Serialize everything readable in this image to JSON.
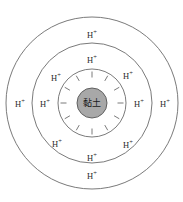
{
  "diagram": {
    "type": "concentric-ion-diagram",
    "title": "",
    "background_color": "#ffffff",
    "center": {
      "x": 92,
      "y": 103
    },
    "core": {
      "label": "黏土",
      "radius": 15,
      "fill_color": "#a8a8a8",
      "stroke_color": "#555555"
    },
    "rings": [
      {
        "name": "inner-ring",
        "radius": 34,
        "stroke_color": "#6b6b6b"
      },
      {
        "name": "middle-ring",
        "radius": 60,
        "stroke_color": "#6b6b6b"
      },
      {
        "name": "outer-ring",
        "radius": 86,
        "stroke_color": "#6b6b6b"
      }
    ],
    "negative_charges": {
      "symbol": "−",
      "count": 12,
      "radius": 29,
      "angles_deg": [
        0,
        30,
        60,
        90,
        120,
        150,
        180,
        210,
        240,
        270,
        300,
        330
      ]
    },
    "ion_labels": [
      {
        "text": "H",
        "charge": "+",
        "ring": "outer-ring",
        "position": "top",
        "x": 92,
        "y": 35
      },
      {
        "text": "H",
        "charge": "+",
        "ring": "outer-ring",
        "position": "bottom",
        "x": 92,
        "y": 176
      },
      {
        "text": "H",
        "charge": "+",
        "ring": "outer-ring",
        "position": "left",
        "x": 20,
        "y": 104
      },
      {
        "text": "H",
        "charge": "+",
        "ring": "outer-ring",
        "position": "right",
        "x": 165,
        "y": 104
      },
      {
        "text": "H",
        "charge": "+",
        "ring": "middle-ring",
        "position": "top",
        "x": 92,
        "y": 60
      },
      {
        "text": "H",
        "charge": "+",
        "ring": "middle-ring",
        "position": "bottom",
        "x": 92,
        "y": 158
      },
      {
        "text": "H",
        "charge": "+",
        "ring": "middle-ring",
        "position": "left",
        "x": 45,
        "y": 104
      },
      {
        "text": "H",
        "charge": "+",
        "ring": "middle-ring",
        "position": "right",
        "x": 139,
        "y": 104
      },
      {
        "text": "H",
        "charge": "+",
        "ring": "inner-ring",
        "position": "top-left",
        "x": 56,
        "y": 78
      },
      {
        "text": "H",
        "charge": "+",
        "ring": "inner-ring",
        "position": "top-right",
        "x": 128,
        "y": 76
      },
      {
        "text": "H",
        "charge": "+",
        "ring": "inner-ring",
        "position": "bottom-left",
        "x": 57,
        "y": 144
      },
      {
        "text": "H",
        "charge": "+",
        "ring": "inner-ring",
        "position": "bottom-right",
        "x": 128,
        "y": 145
      }
    ]
  }
}
